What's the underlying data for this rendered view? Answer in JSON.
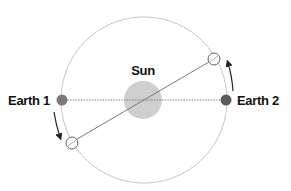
{
  "diagram": {
    "type": "orbital-parallax",
    "labels": {
      "sun": "Sun",
      "earth1": "Earth 1",
      "earth2": "Earth 2"
    },
    "colors": {
      "orbit": "#8a8a8a",
      "sun": "#cfcfcf",
      "earth": "#707070",
      "line": "#6a6a6a",
      "text": "#111111"
    },
    "elements": {
      "orbit": "Earth orbit around the Sun (thin circle)",
      "sun": "Sun at orbit center (light gray disk)",
      "earth_positions": [
        "Earth 1 (left, filled)",
        "Earth 2 (right, filled)"
      ],
      "intermediate_positions": [
        "open circle upper-right",
        "open circle lower-left"
      ],
      "lines": [
        "dotted line Earth 1 to Earth 2 through Sun",
        "solid line between open circles through Sun"
      ],
      "arrows": [
        "counterclockwise arrow near Earth 1 pointing down",
        "counterclockwise arrow near Earth 2 pointing up"
      ]
    }
  }
}
